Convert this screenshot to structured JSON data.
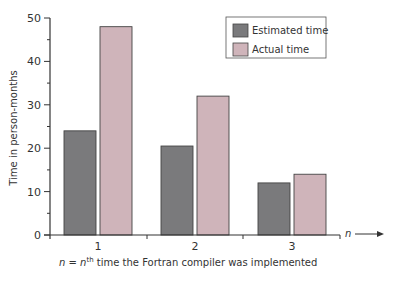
{
  "chart_data": {
    "type": "bar",
    "title": "",
    "categories": [
      "1",
      "2",
      "3"
    ],
    "series": [
      {
        "name": "Estimated time",
        "values": [
          24,
          20.5,
          12
        ],
        "color": "#7a7a7c"
      },
      {
        "name": "Actual time",
        "values": [
          48,
          32,
          14
        ],
        "color": "#cfb4ba"
      }
    ],
    "xlabel": "n = nth time the Fortran compiler was implemented",
    "xlabel_parts": {
      "n1": "n",
      "eq": " = ",
      "n2": "n",
      "sup": "th",
      "rest": " time the Fortran compiler was implemented"
    },
    "x_axis_arrow_label": "n",
    "ylabel": "Time in person-months",
    "ylim": [
      0,
      50
    ],
    "yticks": [
      0,
      10,
      20,
      30,
      40,
      50
    ],
    "grid": false,
    "legend_position": "top-right"
  }
}
